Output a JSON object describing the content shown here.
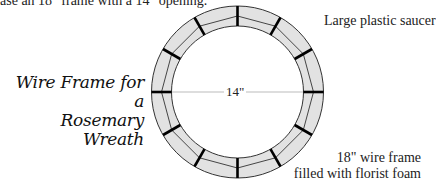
{
  "caption_fragment": "ase an 18\" frame with a 14\" opening.",
  "title": {
    "line1": "Wire Frame for a",
    "line2": "Rosemary Wreath"
  },
  "labels": {
    "saucer": "Large plastic saucer",
    "frame_line1": "18\" wire frame",
    "frame_line2": "filled with florist foam",
    "inner_diameter": "14\""
  },
  "diagram": {
    "center": [
      237.5,
      92
    ],
    "outer_radius": 86,
    "inner_radius": 66,
    "middle_radius": 76,
    "spoke_count": 12,
    "ring_fill": "#e2e2e2",
    "line_color": "#333333",
    "spoke_color": "#000000",
    "diameter_line_color": "#aaaaaa"
  }
}
